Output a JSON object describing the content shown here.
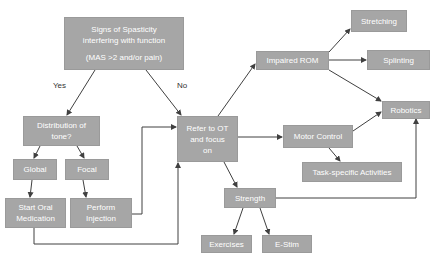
{
  "diagram": {
    "type": "flowchart",
    "colors": {
      "node_fill": "#a6a6a6",
      "node_text": "#ffffff",
      "edge": "#404040",
      "background": "#ffffff"
    },
    "nodes": {
      "signs": {
        "lines": [
          "Signs of Spasticity",
          "interfering with function",
          "",
          "(MAS >2 and/or pain)"
        ]
      },
      "distribution": {
        "lines": [
          "Distribution of",
          "tone?"
        ]
      },
      "global": {
        "label": "Global"
      },
      "focal": {
        "label": "Focal"
      },
      "oral_med": {
        "lines": [
          "Start Oral",
          "Medication"
        ]
      },
      "injection": {
        "lines": [
          "Perform",
          "Injection"
        ]
      },
      "refer_ot": {
        "lines": [
          "Refer to OT",
          "and focus",
          "on"
        ]
      },
      "impaired_rom": {
        "label": "Impaired ROM"
      },
      "stretching": {
        "label": "Stretching"
      },
      "splinting": {
        "label": "Splinting"
      },
      "robotics": {
        "label": "Robotics"
      },
      "motor_control": {
        "label": "Motor Control"
      },
      "task_specific": {
        "label": "Task-specific Activities"
      },
      "strength": {
        "label": "Strength"
      },
      "exercises": {
        "label": "Exercises"
      },
      "estim": {
        "label": "E-Stim"
      }
    },
    "edge_labels": {
      "yes": "Yes",
      "no": "No"
    },
    "edges": [
      {
        "from": "signs",
        "to": "distribution",
        "label": "Yes"
      },
      {
        "from": "signs",
        "to": "refer_ot",
        "label": "No"
      },
      {
        "from": "distribution",
        "to": "global"
      },
      {
        "from": "distribution",
        "to": "focal"
      },
      {
        "from": "global",
        "to": "oral_med"
      },
      {
        "from": "focal",
        "to": "injection"
      },
      {
        "from": "injection",
        "to": "refer_ot"
      },
      {
        "from": "oral_med",
        "to": "refer_ot"
      },
      {
        "from": "refer_ot",
        "to": "impaired_rom"
      },
      {
        "from": "refer_ot",
        "to": "motor_control"
      },
      {
        "from": "refer_ot",
        "to": "strength"
      },
      {
        "from": "impaired_rom",
        "to": "stretching"
      },
      {
        "from": "impaired_rom",
        "to": "splinting"
      },
      {
        "from": "impaired_rom",
        "to": "robotics"
      },
      {
        "from": "motor_control",
        "to": "robotics"
      },
      {
        "from": "motor_control",
        "to": "task_specific"
      },
      {
        "from": "strength",
        "to": "robotics"
      },
      {
        "from": "strength",
        "to": "exercises"
      },
      {
        "from": "strength",
        "to": "estim"
      }
    ]
  }
}
